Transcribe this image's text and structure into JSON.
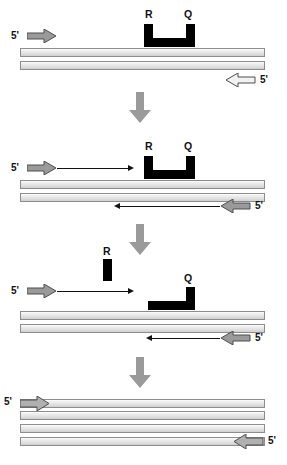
{
  "figure": {
    "width": 287,
    "height": 465,
    "colors": {
      "probe_black": "#000000",
      "strand_fill": "#dedede",
      "strand_border": "#8d8d8d",
      "gray_arrow_fill": "#9a9a9a",
      "white_arrow_fill": "#f2f2f2",
      "arrow_outline": "#4d4d4d",
      "process_arrow": "#9a9a9a",
      "text": "#111111",
      "background": "#ffffff"
    },
    "legend_glyphs": {
      "reporter": "R",
      "quencher": "Q",
      "five_prime": "5'"
    }
  },
  "panels": [
    {
      "id": "panel-1",
      "name": "polymerization-start",
      "labels": {
        "reporter": "R",
        "quencher": "Q",
        "forward_primer_end": "5'",
        "reverse_primer_end": "5'"
      },
      "probe_shape": "u-shape-hairpin",
      "strand_count": 2,
      "extension": "none"
    },
    {
      "id": "panel-2",
      "name": "strand-displacement",
      "labels": {
        "reporter": "R",
        "quencher": "Q",
        "forward_primer_end": "5'",
        "reverse_primer_end": "5'"
      },
      "probe_shape": "u-shape-hairpin",
      "strand_count": 2,
      "extension": "both-strands"
    },
    {
      "id": "panel-3",
      "name": "probe-cleavage",
      "labels": {
        "reporter": "R",
        "quencher": "Q",
        "forward_primer_end": "5'",
        "reverse_primer_end": "5'"
      },
      "probe_shape": "l-shape-quencher-only",
      "reporter_state": "released",
      "strand_count": 2,
      "extension": "both-strands"
    },
    {
      "id": "panel-4",
      "name": "polymerization-complete",
      "labels": {
        "forward_primer_end": "5'",
        "reverse_primer_end": "5'"
      },
      "probe_shape": "none",
      "strand_count": 4,
      "extension": "complete"
    }
  ],
  "process_arrows": [
    {
      "id": "process-arrow-1",
      "direction": "down"
    },
    {
      "id": "process-arrow-2",
      "direction": "down"
    },
    {
      "id": "process-arrow-3",
      "direction": "down"
    }
  ]
}
